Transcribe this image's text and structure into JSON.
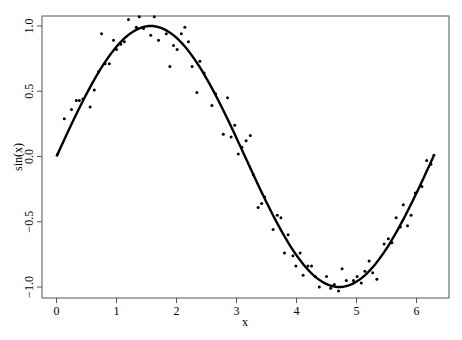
{
  "chart_data": {
    "type": "scatter",
    "title": "",
    "xlabel": "x",
    "ylabel": "sin(x)",
    "xlim": [
      -0.24,
      6.54
    ],
    "ylim": [
      -1.08,
      1.08
    ],
    "x_ticks": [
      0,
      1,
      2,
      3,
      4,
      5,
      6
    ],
    "x_tick_labels": [
      "0",
      "1",
      "2",
      "3",
      "4",
      "5",
      "6"
    ],
    "y_ticks": [
      -1.0,
      -0.5,
      0.0,
      0.5,
      1.0
    ],
    "y_tick_labels": [
      "-1.0",
      "-0.5",
      "0.0",
      "0.5",
      "1.0"
    ],
    "grid": false,
    "legend": null,
    "series": [
      {
        "name": "noisy observations",
        "kind": "points",
        "color": "#000000",
        "x": [
          0.02,
          0.13,
          0.25,
          0.33,
          0.38,
          0.44,
          0.56,
          0.63,
          0.7,
          0.75,
          0.81,
          0.88,
          0.95,
          1.0,
          1.07,
          1.13,
          1.2,
          1.33,
          1.38,
          1.45,
          1.57,
          1.63,
          1.7,
          1.83,
          1.89,
          1.95,
          2.01,
          2.08,
          2.14,
          2.2,
          2.26,
          2.34,
          2.39,
          2.46,
          2.59,
          2.65,
          2.78,
          2.85,
          2.91,
          2.97,
          3.03,
          3.09,
          3.16,
          3.23,
          3.28,
          3.36,
          3.42,
          3.47,
          3.61,
          3.68,
          3.74,
          3.8,
          3.86,
          3.94,
          3.99,
          4.06,
          4.11,
          4.19,
          4.25,
          4.31,
          4.38,
          4.5,
          4.57,
          4.63,
          4.7,
          4.76,
          4.83,
          4.95,
          5.01,
          5.08,
          5.14,
          5.21,
          5.27,
          5.34,
          5.46,
          5.53,
          5.59,
          5.66,
          5.73,
          5.78,
          5.85,
          5.91,
          5.98,
          6.09,
          6.17,
          6.24,
          6.29
        ],
        "y": [
          0.02,
          0.29,
          0.36,
          0.43,
          0.43,
          0.44,
          0.38,
          0.51,
          0.65,
          0.94,
          0.71,
          0.71,
          0.89,
          0.82,
          0.86,
          0.88,
          1.05,
          0.99,
          1.07,
          0.98,
          0.93,
          1.07,
          0.89,
          0.94,
          0.69,
          0.85,
          0.82,
          0.94,
          0.99,
          0.88,
          0.69,
          0.49,
          0.73,
          0.64,
          0.39,
          0.48,
          0.17,
          0.45,
          0.15,
          0.24,
          0.02,
          0.07,
          0.12,
          0.16,
          -0.14,
          -0.39,
          -0.36,
          -0.31,
          -0.56,
          -0.45,
          -0.47,
          -0.74,
          -0.6,
          -0.76,
          -0.84,
          -0.74,
          -0.91,
          -0.84,
          -0.84,
          -0.92,
          -1.0,
          -0.92,
          -1.01,
          -0.98,
          -1.03,
          -0.86,
          -0.95,
          -0.95,
          -0.92,
          -0.97,
          -0.88,
          -0.8,
          -0.89,
          -0.94,
          -0.67,
          -0.63,
          -0.66,
          -0.47,
          -0.54,
          -0.37,
          -0.53,
          -0.45,
          -0.28,
          -0.23,
          -0.03,
          -0.06,
          0.01
        ]
      },
      {
        "name": "sin(x)",
        "kind": "line",
        "color": "#000000",
        "function": "sin(x)",
        "x_range": [
          0,
          6.2832
        ],
        "line_width": 2
      }
    ]
  }
}
